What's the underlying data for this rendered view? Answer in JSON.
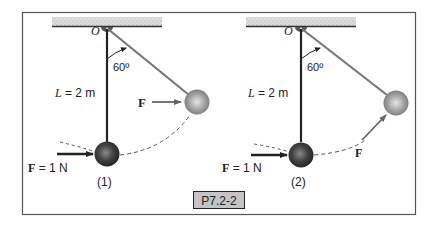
{
  "figure": {
    "label": "P7.2-2",
    "frame_color": "#555555",
    "label_bg": "#c4c4c4"
  },
  "panels": [
    {
      "id": "1",
      "caption": "(1)",
      "pivot_label": "O",
      "angle_label": "60º",
      "length_label_var": "L",
      "length_label_val": " = 2 m",
      "force_label_bold": "F",
      "force_label_val": " = 1 N",
      "swung_force_label": "F"
    },
    {
      "id": "2",
      "caption": "(2)",
      "pivot_label": "O",
      "angle_label": "60º",
      "length_label_var": "L",
      "length_label_val": " = 2 m",
      "force_label_bold": "F",
      "force_label_val": " = 1 N",
      "swung_force_label": "F"
    }
  ],
  "colors": {
    "rod": "#222222",
    "swung_rod": "#777777",
    "ceiling_hatch": "#cfcfcf",
    "bob_dark": "#3a3a3a",
    "bob_light": "#9a9a9a"
  }
}
